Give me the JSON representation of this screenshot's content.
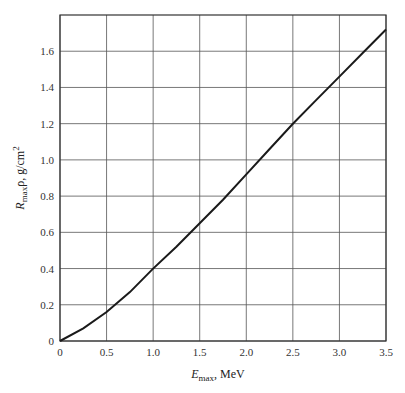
{
  "chart_data": {
    "type": "line",
    "title": "",
    "xlabel": "E_max, MeV",
    "ylabel": "R_max ρ, g/cm²",
    "xlabel_parts": {
      "sym": "E",
      "sub": "max",
      "rest": ", MeV"
    },
    "ylabel_parts": {
      "sym": "R",
      "sub": "max",
      "rest": "ρ, g/cm",
      "sup": "2"
    },
    "xlim": [
      0,
      3.5
    ],
    "ylim": [
      0,
      1.8
    ],
    "grid": true,
    "x_ticks": [
      "0",
      "0.5",
      "1.0",
      "1.5",
      "2.0",
      "2.5",
      "3.0",
      "3.5"
    ],
    "y_ticks": [
      "0",
      "0.2",
      "0.4",
      "0.6",
      "0.8",
      "1.0",
      "1.2",
      "1.4",
      "1.6"
    ],
    "series": [
      {
        "name": "Range-energy curve",
        "x": [
          0,
          0.25,
          0.5,
          0.75,
          1.0,
          1.25,
          1.5,
          1.75,
          2.0,
          2.25,
          2.5,
          2.75,
          3.0,
          3.25,
          3.5
        ],
        "y": [
          0,
          0.07,
          0.16,
          0.27,
          0.4,
          0.52,
          0.65,
          0.78,
          0.92,
          1.06,
          1.2,
          1.33,
          1.46,
          1.59,
          1.72
        ]
      }
    ]
  }
}
